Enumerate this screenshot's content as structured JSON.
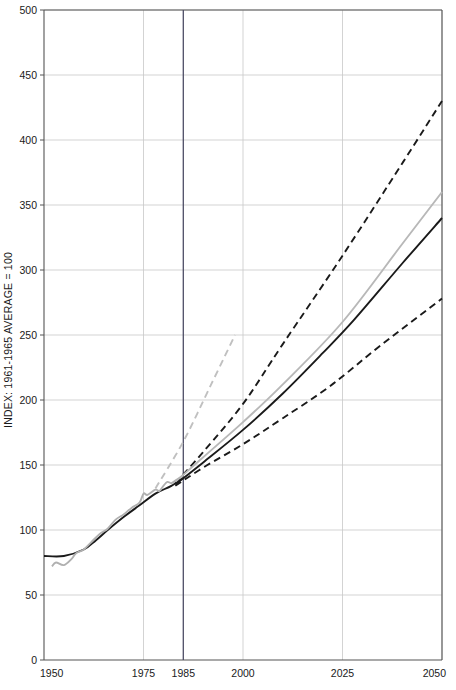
{
  "chart_data": {
    "type": "line",
    "title": "",
    "subtitle": "",
    "xlabel": "",
    "ylabel": "INDEX: 1961-1965 AVERAGE = 100",
    "xlim": [
      1950,
      2050
    ],
    "ylim": [
      0,
      500
    ],
    "grid": true,
    "legend_position": "none",
    "x_ticks": [
      1950,
      1975,
      1985,
      2000,
      2025,
      2050
    ],
    "x_tick_labels": [
      "1950",
      "1975",
      "1985",
      "2000",
      "2025",
      "2050"
    ],
    "y_ticks": [
      0,
      50,
      100,
      150,
      200,
      250,
      300,
      350,
      400,
      450,
      500
    ],
    "y_tick_labels": [
      "0",
      "50",
      "100",
      "150",
      "200",
      "250",
      "300",
      "350",
      "400",
      "450",
      "500"
    ],
    "reference_lines": [
      {
        "name": "year-1985-marker",
        "type": "vertical",
        "x": 1985,
        "color": "#4d4d66",
        "width": 1.3
      }
    ],
    "colors": {
      "trend_black": "#1a1a1a",
      "observed_gray": "#b0b0b0",
      "projection_high": "#1a1a1a",
      "projection_low": "#1a1a1a",
      "projection_gray_solid": "#b8b8b8",
      "projection_gray_dashed": "#c0c0c0",
      "grid": "#c8c8c8",
      "axis": "#555555",
      "reference_1985": "#4d4d66"
    },
    "series": [
      {
        "name": "historical-trend-black",
        "style": "solid",
        "color": "#1a1a1a",
        "width": 1.9,
        "x": [
          1950,
          1955,
          1960,
          1963,
          1966,
          1970,
          1974,
          1978,
          1982,
          1985
        ],
        "values": [
          80,
          80,
          85,
          92,
          100,
          110,
          119,
          128,
          134,
          140
        ]
      },
      {
        "name": "historical-observed-gray",
        "style": "solid",
        "color": "#b0b0b0",
        "width": 1.9,
        "x": [
          1952,
          1953,
          1955,
          1957,
          1958,
          1960,
          1962,
          1964,
          1966,
          1968,
          1970,
          1972,
          1974,
          1975,
          1976,
          1978,
          1979,
          1980,
          1981,
          1982,
          1983,
          1984,
          1985
        ],
        "values": [
          72,
          75,
          73,
          78,
          82,
          85,
          91,
          97,
          101,
          108,
          112,
          117,
          121,
          128,
          127,
          131,
          130,
          134,
          137,
          136,
          138,
          140,
          142
        ]
      },
      {
        "name": "projection-high-dashed",
        "style": "dashed",
        "color": "#1a1a1a",
        "width": 1.9,
        "x": [
          1983,
          1990,
          2000,
          2010,
          2025,
          2040,
          2050
        ],
        "values": [
          136,
          160,
          197,
          243,
          311,
          382,
          430
        ]
      },
      {
        "name": "projection-medium-gray-solid",
        "style": "solid",
        "color": "#b8b8b8",
        "width": 1.9,
        "x": [
          1983,
          1990,
          2000,
          2010,
          2025,
          2040,
          2050
        ],
        "values": [
          137,
          156,
          183,
          212,
          260,
          320,
          360
        ]
      },
      {
        "name": "projection-medium-black-solid",
        "style": "solid",
        "color": "#1a1a1a",
        "width": 1.9,
        "x": [
          1983,
          1990,
          2000,
          2010,
          2020,
          2028,
          2040,
          2050
        ],
        "values": [
          135,
          152,
          177,
          205,
          236,
          262,
          305,
          340
        ]
      },
      {
        "name": "projection-low-dashed",
        "style": "dashed",
        "color": "#1a1a1a",
        "width": 1.9,
        "x": [
          1983,
          1990,
          2000,
          2010,
          2022,
          2035,
          2050
        ],
        "values": [
          134,
          148,
          166,
          186,
          211,
          243,
          278
        ]
      },
      {
        "name": "projection-short-gray-dashed",
        "style": "dashed",
        "color": "#c0c0c0",
        "width": 1.9,
        "x": [
          1978,
          1985,
          1992,
          1998
        ],
        "values": [
          132,
          168,
          212,
          250
        ]
      }
    ]
  }
}
